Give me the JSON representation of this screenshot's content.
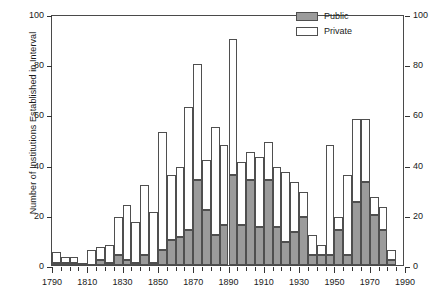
{
  "chart_data": {
    "type": "bar",
    "stacked": true,
    "title": "",
    "xlabel": "",
    "ylabel": "Number of Institutions Established in Interval",
    "xlim": [
      1790,
      1990
    ],
    "ylim": [
      0,
      100
    ],
    "bin_width": 5,
    "grid": false,
    "legend_position": "top-right",
    "axis_right_mirrored": true,
    "xticks": [
      1790,
      1810,
      1830,
      1850,
      1870,
      1890,
      1910,
      1930,
      1950,
      1970,
      1990
    ],
    "xtick_labels": [
      "1790",
      "1810",
      "1830",
      "1850",
      "1870",
      "1890",
      "1910",
      "1930",
      "1950",
      "1970",
      "1990"
    ],
    "xminor_step": 5,
    "yticks": [
      0,
      20,
      40,
      60,
      80,
      100
    ],
    "ytick_labels": [
      "0",
      "20",
      "40",
      "60",
      "80",
      "100"
    ],
    "categories": [
      1790,
      1795,
      1800,
      1805,
      1810,
      1815,
      1820,
      1825,
      1830,
      1835,
      1840,
      1845,
      1850,
      1855,
      1860,
      1865,
      1870,
      1875,
      1880,
      1885,
      1890,
      1895,
      1900,
      1905,
      1910,
      1915,
      1920,
      1925,
      1930,
      1935,
      1940,
      1945,
      1950,
      1955,
      1960,
      1965,
      1970,
      1975,
      1980
    ],
    "series": [
      {
        "name": "Public",
        "color": "#9b9b9b",
        "values": [
          1,
          1,
          1,
          0,
          0,
          2,
          1,
          4,
          2,
          1,
          4,
          1,
          6,
          10,
          11,
          14,
          34,
          22,
          12,
          16,
          36,
          16,
          34,
          15,
          34,
          15,
          9,
          13,
          19,
          4,
          4,
          4,
          14,
          4,
          25,
          33,
          20,
          14,
          2
        ]
      },
      {
        "name": "Private",
        "color": "#ffffff",
        "values": [
          4,
          2,
          2,
          1,
          6,
          5,
          7,
          15,
          22,
          16,
          28,
          20,
          47,
          26,
          28,
          49,
          46,
          20,
          43,
          32,
          54,
          25,
          11,
          28,
          15,
          24,
          28,
          20,
          10,
          8,
          4,
          44,
          5,
          32,
          33,
          25,
          7,
          9,
          4
        ]
      }
    ],
    "totals": [
      5,
      3,
      3,
      1,
      6,
      7,
      8,
      19,
      24,
      17,
      32,
      21,
      53,
      36,
      39,
      63,
      80,
      42,
      55,
      48,
      90,
      41,
      45,
      43,
      49,
      39,
      37,
      33,
      29,
      12,
      8,
      48,
      19,
      36,
      58,
      58,
      27,
      23,
      6
    ]
  },
  "legend": {
    "items": [
      {
        "label": "Public",
        "swatch": "public-swatch"
      },
      {
        "label": "Private",
        "swatch": "private-swatch"
      }
    ]
  }
}
